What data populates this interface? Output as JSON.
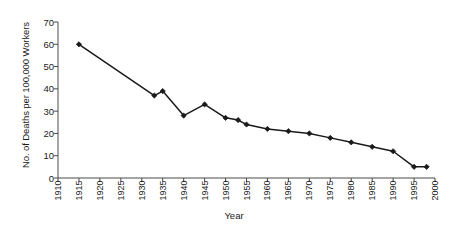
{
  "chart_data": {
    "type": "line",
    "title": "",
    "xlabel": "Year",
    "ylabel": "No. of Deaths per 100,000 Workers",
    "xlim": [
      1910,
      2000
    ],
    "ylim": [
      0,
      70
    ],
    "xticks": [
      1910,
      1915,
      1920,
      1925,
      1930,
      1935,
      1940,
      1945,
      1950,
      1955,
      1960,
      1965,
      1970,
      1975,
      1980,
      1985,
      1990,
      1995,
      2000
    ],
    "yticks": [
      0,
      10,
      20,
      30,
      40,
      50,
      60,
      70
    ],
    "grid": false,
    "legend": null,
    "series": [
      {
        "name": "Occupational deaths",
        "marker": "diamond",
        "color": "#1a1a1a",
        "x": [
          1915,
          1933,
          1935,
          1940,
          1945,
          1950,
          1953,
          1955,
          1960,
          1965,
          1970,
          1975,
          1980,
          1985,
          1990,
          1995,
          1998
        ],
        "values": [
          60,
          37,
          39,
          28,
          33,
          27,
          26,
          24,
          22,
          21,
          20,
          18,
          16,
          14,
          12,
          5,
          5
        ]
      }
    ]
  },
  "axis": {
    "x_tick_labels": [
      "1910",
      "1915",
      "1920",
      "1925",
      "1930",
      "1935",
      "1940",
      "1945",
      "1950",
      "1955",
      "1960",
      "1965",
      "1970",
      "1975",
      "1980",
      "1985",
      "1990",
      "1995",
      "2000"
    ],
    "y_tick_labels": [
      "0",
      "10",
      "20",
      "30",
      "40",
      "50",
      "60",
      "70"
    ]
  }
}
